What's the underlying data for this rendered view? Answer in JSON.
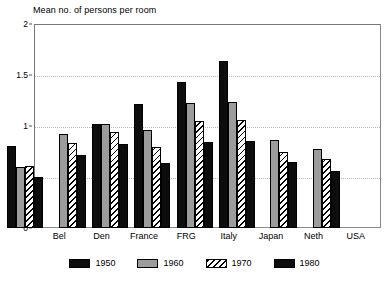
{
  "chart_data": {
    "type": "bar",
    "title": "Mean no. of persons per room",
    "xlabel": "",
    "ylabel": "",
    "ylim": [
      0,
      2
    ],
    "yticks": [
      0,
      0.5,
      1,
      1.5,
      2
    ],
    "ytick_labels": [
      "0",
      "0.5",
      "1",
      "1.5",
      "2"
    ],
    "grid": true,
    "legend_position": "bottom",
    "categories": [
      "Bel",
      "Den",
      "France",
      "FRG",
      "Italy",
      "Japan",
      "Neth",
      "USA"
    ],
    "series": [
      {
        "name": "1950",
        "color": "#0d0d0d",
        "fill": "solid-black",
        "values": [
          0.8,
          null,
          1.02,
          1.22,
          1.43,
          1.64,
          null,
          null
        ]
      },
      {
        "name": "1960",
        "color": "#9c9c9c",
        "fill": "solid-gray",
        "values": [
          0.6,
          0.92,
          1.02,
          0.96,
          1.23,
          1.24,
          0.86,
          0.77
        ]
      },
      {
        "name": "1970",
        "color": "#ffffff",
        "fill": "diagonal-hatch",
        "values": [
          0.61,
          0.83,
          0.94,
          0.79,
          1.05,
          1.06,
          0.75,
          0.68
        ]
      },
      {
        "name": "1980",
        "color": "#0d0d0d",
        "fill": "solid-black",
        "values": [
          0.5,
          0.72,
          0.82,
          0.64,
          0.84,
          0.85,
          0.65,
          0.56
        ]
      }
    ]
  }
}
